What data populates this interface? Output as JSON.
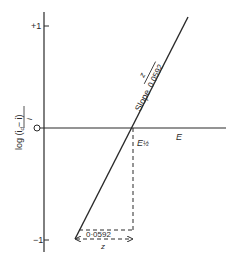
{
  "diagram": {
    "y_axis": {
      "label": "log (i",
      "label_sub": "d",
      "label_rest": "− i)",
      "label_denominator": "i",
      "ticks": [
        {
          "label": "+1",
          "value": 1
        },
        {
          "label": "−1",
          "value": -1
        }
      ],
      "origin_label": "O"
    },
    "x_axis": {
      "label": "E"
    },
    "line": {
      "slope_label": "Slope",
      "slope_numerator": "z",
      "slope_denominator": "0.0592"
    },
    "half_wave": {
      "label": "E",
      "label_sub": "½"
    },
    "dimension": {
      "top_label": "0·0592",
      "bottom_label": "z"
    },
    "colors": {
      "ink": "#2a2a2a",
      "background": "#ffffff"
    }
  }
}
